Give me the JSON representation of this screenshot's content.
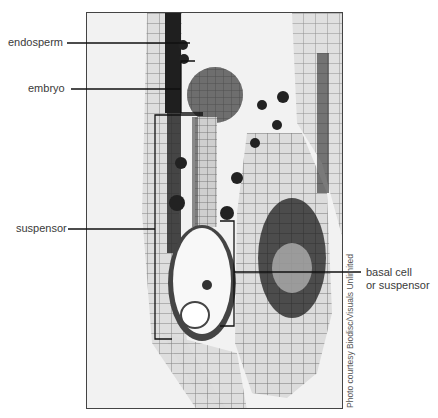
{
  "figure": {
    "type": "labeled micrograph",
    "labels": [
      {
        "id": "endosperm",
        "text": "endosperm"
      },
      {
        "id": "embryo",
        "text": "embryo"
      },
      {
        "id": "suspensor",
        "text": "suspensor"
      },
      {
        "id": "basal",
        "line1": "basal cell",
        "line2": "or suspensor"
      }
    ],
    "credit": "Photo courtesy Biodisc/Visuals Unlimited",
    "colors": {
      "line": "#1a1a1a",
      "text": "#3a3a3a",
      "frame": "#444444"
    }
  }
}
